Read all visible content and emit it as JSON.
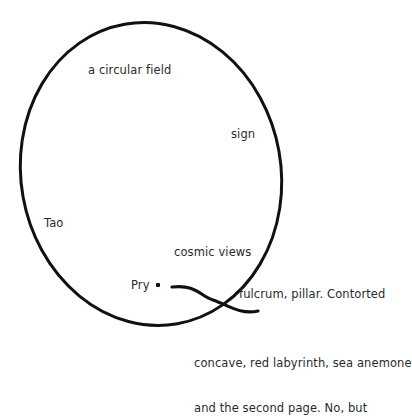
{
  "canvas": {
    "width": 398,
    "height": 378,
    "background": "#ffffff",
    "ink_color": "#111111",
    "text_color": "#2a2a2a"
  },
  "shapes": {
    "ellipse": {
      "name": "large tilted ellipse outline",
      "center_x": 151,
      "center_y": 174,
      "radius_x": 130,
      "radius_y": 152,
      "rotation_deg": -10,
      "stroke_width": 3,
      "stroke_color": "#111111",
      "fill": "none"
    },
    "s_curve": {
      "name": "crossing S-shaped stroke",
      "path": "M 172 287 C 196 284 200 296 213 300 C 228 305 240 315 258 311",
      "stroke_width": 3.2,
      "stroke_color": "#111111",
      "fill": "none"
    }
  },
  "labels": {
    "circular_field": {
      "text": "a circular field",
      "x": 88,
      "y": 63
    },
    "sign": {
      "text": "sign",
      "x": 231,
      "y": 127
    },
    "tao": {
      "text": "Tao",
      "x": 44,
      "y": 216
    },
    "cosmic_views": {
      "text": "cosmic views",
      "x": 174,
      "y": 245
    },
    "pry": {
      "text": "Pry",
      "x": 131,
      "y": 278
    },
    "fulcrum": {
      "text": "fulcrum, pillar. Contorted",
      "x": 239,
      "y": 287
    },
    "bottom_block": {
      "line1": "concave, red labyrinth, sea anemone",
      "line2": "and the second page. No, but",
      "x": 194,
      "y": 326
    }
  },
  "markers": {
    "pry_dot": {
      "name": "pry-point-marker",
      "x": 156,
      "y": 283,
      "size": 4
    }
  }
}
